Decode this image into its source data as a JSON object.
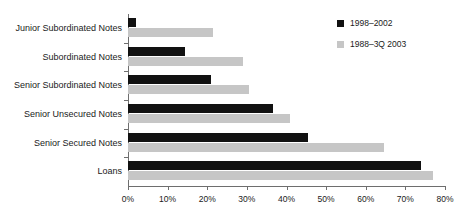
{
  "chart_data": {
    "type": "bar",
    "orientation": "horizontal",
    "title": "",
    "xlabel": "",
    "ylabel": "",
    "xlim": [
      0,
      80
    ],
    "xtick_labels": [
      "0%",
      "10%",
      "20%",
      "30%",
      "40%",
      "50%",
      "60%",
      "70%",
      "80%"
    ],
    "xticks": [
      0,
      10,
      20,
      30,
      40,
      50,
      60,
      70,
      80
    ],
    "grid": false,
    "legend_position": "top-right",
    "categories": [
      "Junior Subordinated Notes",
      "Subordinated Notes",
      "Senior Subordinated Notes",
      "Senior Unsecured Notes",
      "Senior Secured Notes",
      "Loans"
    ],
    "series": [
      {
        "name": "1998–2002",
        "color": "#111111",
        "values": [
          2.0,
          14.5,
          21.0,
          36.5,
          45.5,
          74.0
        ]
      },
      {
        "name": "1988–3Q 2003",
        "color": "#c6c6c6",
        "values": [
          21.5,
          29.0,
          30.5,
          41.0,
          64.5,
          77.0
        ]
      }
    ]
  },
  "legend": {
    "entries": [
      {
        "label": "1998–2002"
      },
      {
        "label": "1988–3Q 2003"
      }
    ]
  },
  "colors": {
    "series_1": "#111111",
    "series_2": "#c6c6c6",
    "axis": "#6e6e6e",
    "text": "#1a1a1a",
    "background": "#ffffff"
  }
}
